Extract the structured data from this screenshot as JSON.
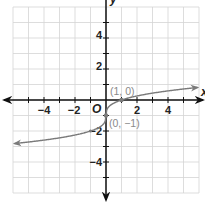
{
  "chart_data": {
    "type": "line",
    "title": "",
    "function": "y = cbrt(x) - 1",
    "xlabel": "x",
    "ylabel": "y",
    "xlim": [
      -6,
      6
    ],
    "ylim": [
      -6,
      6
    ],
    "grid": true,
    "x_ticks": [
      -4,
      -2,
      2,
      4
    ],
    "y_ticks": [
      4,
      2,
      -2,
      -4
    ],
    "x_tick_labels": [
      "−4",
      "−2",
      "2",
      "4"
    ],
    "y_tick_labels": [
      "4",
      "2",
      "−2",
      "−4"
    ],
    "origin_label": "O",
    "series": [
      {
        "name": "curve",
        "x": [
          -6,
          -5,
          -4,
          -3,
          -2,
          -1,
          -0.5,
          -0.1,
          0,
          0.1,
          0.5,
          1,
          2,
          3,
          4,
          5,
          6
        ],
        "y": [
          -2.82,
          -2.71,
          -2.59,
          -2.44,
          -2.26,
          -2,
          -1.79,
          -1.46,
          -1,
          -0.54,
          -0.21,
          0,
          0.26,
          0.44,
          0.59,
          0.71,
          0.82
        ]
      }
    ],
    "annotations": [
      {
        "label": "(1, 0)",
        "x": 1,
        "y": 0
      },
      {
        "label": "(0, −1)",
        "x": 0,
        "y": -1
      }
    ],
    "colors": {
      "grid": "#d4d4d4",
      "axis": "#111111",
      "curve": "#7a7a7a",
      "labels": "#8a8a8a"
    }
  },
  "labels": {
    "x_axis": "x",
    "y_axis": "y",
    "origin": "O",
    "xt_m4": "−4",
    "xt_m2": "−2",
    "xt_2": "2",
    "xt_4": "4",
    "yt_4": "4",
    "yt_2": "2",
    "yt_m2": "−2",
    "yt_m4": "−4",
    "pt1": "(1, 0)",
    "pt2": "(0, −1)"
  }
}
